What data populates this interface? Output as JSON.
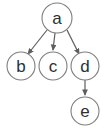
{
  "diagram": {
    "type": "directed-graph",
    "title": "",
    "background_color": "#ffffff",
    "node_fill": "#ffffff",
    "node_stroke": "#7d7d7d",
    "label_color": "#2f2f2f",
    "edge_color": "#5e5e5e",
    "nodes": [
      {
        "id": "a",
        "label": "a",
        "cx": 57,
        "cy": 18,
        "r": 15
      },
      {
        "id": "b",
        "label": "b",
        "cx": 21,
        "cy": 66,
        "r": 14
      },
      {
        "id": "c",
        "label": "c",
        "cx": 53,
        "cy": 66,
        "r": 14
      },
      {
        "id": "d",
        "label": "d",
        "cx": 85,
        "cy": 66,
        "r": 14
      },
      {
        "id": "e",
        "label": "e",
        "cx": 85,
        "cy": 111,
        "r": 14
      }
    ],
    "edges": [
      {
        "from": "a",
        "to": "b",
        "x1": 47,
        "y1": 30,
        "x2": 28,
        "y2": 54,
        "directed": true
      },
      {
        "from": "a",
        "to": "c",
        "x1": 55,
        "y1": 33,
        "x2": 53,
        "y2": 50,
        "directed": true
      },
      {
        "from": "a",
        "to": "d",
        "x1": 67,
        "y1": 30,
        "x2": 79,
        "y2": 54,
        "directed": true
      },
      {
        "from": "d",
        "to": "e",
        "x1": 85,
        "y1": 80,
        "x2": 85,
        "y2": 95,
        "directed": true
      }
    ]
  }
}
